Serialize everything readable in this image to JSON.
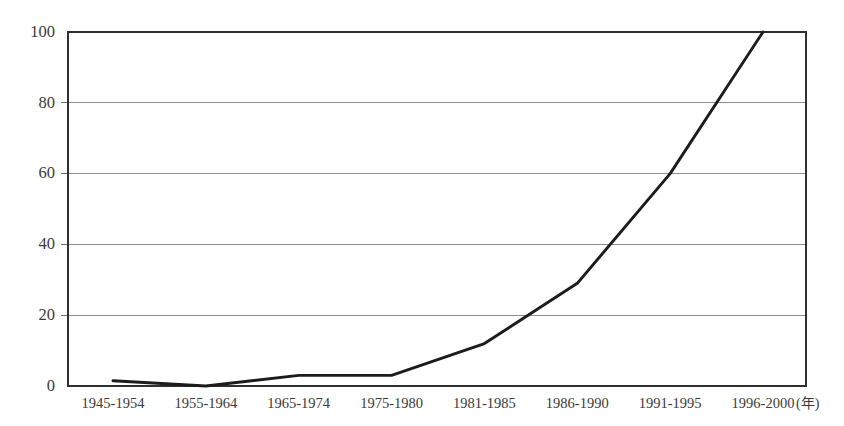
{
  "chart_data": {
    "type": "line",
    "title": "",
    "subtitle": "",
    "xlabel": "",
    "ylabel": "",
    "x_unit_label": "(年)",
    "categories": [
      "1945-1954",
      "1955-1964",
      "1965-1974",
      "1975-1980",
      "1981-1985",
      "1986-1990",
      "1991-1995",
      "1996-2000"
    ],
    "values": [
      1.5,
      0,
      3,
      3,
      12,
      29,
      60,
      100
    ],
    "series": [
      {
        "name": "",
        "values": [
          1.5,
          0,
          3,
          3,
          12,
          29,
          60,
          100
        ],
        "color": "#1c1c1c"
      }
    ],
    "ylim": [
      0,
      100
    ],
    "y_ticks": [
      0,
      20,
      40,
      60,
      80,
      100
    ],
    "y_tick_labels": [
      "0",
      "20",
      "40",
      "60",
      "80",
      "100"
    ],
    "grid": true,
    "grid_axis": "y",
    "legend": false,
    "legend_position": "none",
    "markers": false,
    "background_color": "#ffffff",
    "line_color": "#1c1c1c",
    "grid_color": "#8d8d8d",
    "axis_color": "#303030",
    "text_color": "#3a3a3a",
    "annotations": []
  },
  "geometry": {
    "plot_left": 68,
    "plot_right": 806,
    "plot_top": 32,
    "plot_bottom": 386,
    "first_point_x": 113,
    "last_point_x": 763
  }
}
